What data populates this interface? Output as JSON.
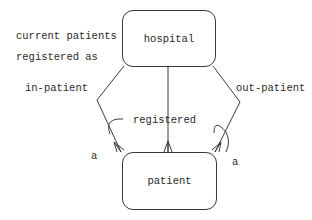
{
  "diagram": {
    "type": "entity-relationship",
    "entities": {
      "hospital": {
        "label": "hospital"
      },
      "patient": {
        "label": "patient"
      }
    },
    "note": {
      "line1": "current patients",
      "line2": "registered as"
    },
    "relationships": {
      "left": {
        "label": "in-patient",
        "cardinality": "many",
        "exclusive_arc_label": "a"
      },
      "middle": {
        "label": "registered",
        "cardinality": "many"
      },
      "right": {
        "label": "out-patient",
        "cardinality": "many",
        "exclusive_arc_label": "a"
      }
    },
    "colors": {
      "line": "#3a3a3a",
      "text": "#2a2a2a",
      "background": "#ffffff"
    }
  }
}
